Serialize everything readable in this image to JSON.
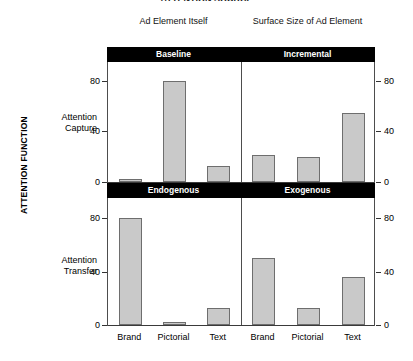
{
  "figure": {
    "cut_off_title": "ATTENTION SOURCE",
    "outer_y_axis_label": "ATTENTION FUNCTION",
    "column_headers": [
      "Ad Element Itself",
      "Surface Size of Ad Element"
    ],
    "row_labels": [
      "Attention Capture",
      "Attention Transfer"
    ],
    "row_label_lines": {
      "capture_line1": "Attention",
      "capture_line2": "Capture",
      "transfer_line1": "Attention",
      "transfer_line2": "Transfer"
    },
    "band_labels": {
      "top_left": "Baseline",
      "top_right": "Incremental",
      "mid_left": "Endogenous",
      "mid_right": "Exogenous"
    },
    "axis_ticks": [
      "0",
      "40",
      "80"
    ],
    "category_labels": [
      "Brand",
      "Pictorial",
      "Text",
      "Brand",
      "Pictorial",
      "Text"
    ],
    "colors": {
      "bar_fill": "#c9c9c9",
      "bar_stroke": "#6e6e6e",
      "band_fill": "#000000",
      "band_text": "#ffffff",
      "axis": "#333333",
      "background": "#ffffff"
    }
  },
  "chart_data": [
    {
      "type": "bar",
      "title": "Attention Capture — Baseline (Ad Element Itself)",
      "panel": "top-left",
      "categories": [
        "Brand",
        "Pictorial",
        "Text"
      ],
      "values": [
        2,
        80,
        13
      ],
      "xlabel": "",
      "ylabel": "Attention Capture",
      "ylim": [
        0,
        95
      ],
      "yticks": [
        0,
        40,
        80
      ],
      "grid": false,
      "legend": "none"
    },
    {
      "type": "bar",
      "title": "Attention Capture — Incremental (Surface Size of Ad Element)",
      "panel": "top-right",
      "categories": [
        "Brand",
        "Pictorial",
        "Text"
      ],
      "values": [
        21,
        20,
        55
      ],
      "xlabel": "",
      "ylabel": "Attention Capture",
      "ylim": [
        0,
        95
      ],
      "yticks": [
        0,
        40,
        80
      ],
      "grid": false,
      "legend": "none"
    },
    {
      "type": "bar",
      "title": "Attention Transfer — Endogenous (Ad Element Itself)",
      "panel": "bottom-left",
      "categories": [
        "Brand",
        "Pictorial",
        "Text"
      ],
      "values": [
        80,
        2,
        13
      ],
      "xlabel": "",
      "ylabel": "Attention Transfer",
      "ylim": [
        0,
        95
      ],
      "yticks": [
        0,
        40,
        80
      ],
      "grid": false,
      "legend": "none"
    },
    {
      "type": "bar",
      "title": "Attention Transfer — Exogenous (Surface Size of Ad Element)",
      "panel": "bottom-right",
      "categories": [
        "Brand",
        "Pictorial",
        "Text"
      ],
      "values": [
        50,
        13,
        36
      ],
      "xlabel": "",
      "ylabel": "Attention Transfer",
      "ylim": [
        0,
        95
      ],
      "yticks": [
        0,
        40,
        80
      ],
      "grid": false,
      "legend": "none"
    }
  ]
}
